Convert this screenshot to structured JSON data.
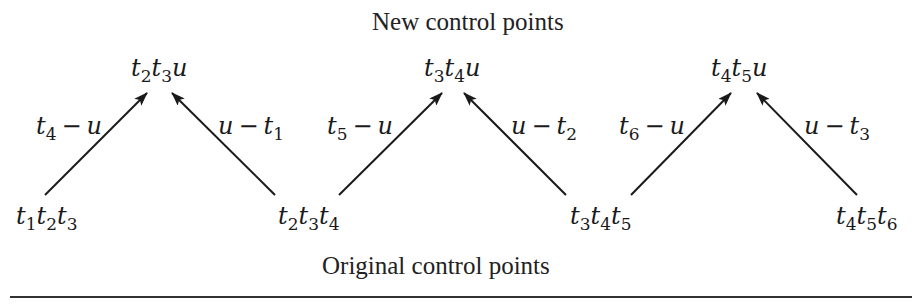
{
  "captions": {
    "top": "New control points",
    "bottom": "Original control points"
  },
  "new_points": [
    {
      "parts": [
        [
          "t",
          "2"
        ],
        [
          "t",
          "3"
        ],
        [
          "u",
          ""
        ]
      ]
    },
    {
      "parts": [
        [
          "t",
          "3"
        ],
        [
          "t",
          "4"
        ],
        [
          "u",
          ""
        ]
      ]
    },
    {
      "parts": [
        [
          "t",
          "4"
        ],
        [
          "t",
          "5"
        ],
        [
          "u",
          ""
        ]
      ]
    }
  ],
  "original_points": [
    {
      "parts": [
        [
          "t",
          "1"
        ],
        [
          "t",
          "2"
        ],
        [
          "t",
          "3"
        ]
      ]
    },
    {
      "parts": [
        [
          "t",
          "2"
        ],
        [
          "t",
          "3"
        ],
        [
          "t",
          "4"
        ]
      ]
    },
    {
      "parts": [
        [
          "t",
          "3"
        ],
        [
          "t",
          "4"
        ],
        [
          "t",
          "5"
        ]
      ]
    },
    {
      "parts": [
        [
          "t",
          "4"
        ],
        [
          "t",
          "5"
        ],
        [
          "t",
          "6"
        ]
      ]
    }
  ],
  "weights": [
    {
      "a": "t",
      "a_sub": "4",
      "op": "−",
      "b": "u",
      "b_sub": ""
    },
    {
      "a": "u",
      "a_sub": "",
      "op": "−",
      "b": "t",
      "b_sub": "1"
    },
    {
      "a": "t",
      "a_sub": "5",
      "op": "−",
      "b": "u",
      "b_sub": ""
    },
    {
      "a": "u",
      "a_sub": "",
      "op": "−",
      "b": "t",
      "b_sub": "2"
    },
    {
      "a": "t",
      "a_sub": "6",
      "op": "−",
      "b": "u",
      "b_sub": ""
    },
    {
      "a": "u",
      "a_sub": "",
      "op": "−",
      "b": "t",
      "b_sub": "3"
    }
  ],
  "arrows": [
    {
      "from": "t1t2t3",
      "to": "t2t3u",
      "x1": 45,
      "y1": 195,
      "x2": 147,
      "y2": 93
    },
    {
      "from": "t2t3t4",
      "to": "t2t3u",
      "x1": 275,
      "y1": 195,
      "x2": 172,
      "y2": 93
    },
    {
      "from": "t2t3t4",
      "to": "t3t4u",
      "x1": 339,
      "y1": 195,
      "x2": 442,
      "y2": 93
    },
    {
      "from": "t3t4t5",
      "to": "t3t4u",
      "x1": 566,
      "y1": 195,
      "x2": 464,
      "y2": 93
    },
    {
      "from": "t3t4t5",
      "to": "t4t5u",
      "x1": 631,
      "y1": 195,
      "x2": 731,
      "y2": 93
    },
    {
      "from": "t4t5t6",
      "to": "t4t5u",
      "x1": 857,
      "y1": 195,
      "x2": 757,
      "y2": 93
    }
  ],
  "colors": {
    "ink": "#1a1a1a",
    "rule": "#333333",
    "background": "#ffffff"
  }
}
